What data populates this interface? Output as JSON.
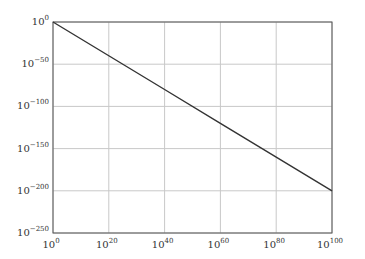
{
  "chart_data": {
    "type": "line",
    "title": "",
    "xlabel": "",
    "ylabel": "",
    "xscale": "log",
    "yscale": "log",
    "xlim_exponent": [
      0,
      100
    ],
    "ylim_exponent": [
      -250,
      0
    ],
    "grid": true,
    "legend": null,
    "x_ticks": [
      {
        "base": "10",
        "exp": "0"
      },
      {
        "base": "10",
        "exp": "20"
      },
      {
        "base": "10",
        "exp": "40"
      },
      {
        "base": "10",
        "exp": "60"
      },
      {
        "base": "10",
        "exp": "80"
      },
      {
        "base": "10",
        "exp": "100"
      }
    ],
    "y_ticks": [
      {
        "base": "10",
        "exp": "0"
      },
      {
        "base": "10",
        "exp": "−50"
      },
      {
        "base": "10",
        "exp": "−100"
      },
      {
        "base": "10",
        "exp": "−150"
      },
      {
        "base": "10",
        "exp": "−200"
      },
      {
        "base": "10",
        "exp": "−250"
      }
    ],
    "series": [
      {
        "name": "y = x^-2",
        "color": "#333333",
        "x_exponent": [
          0,
          20,
          40,
          60,
          80,
          100
        ],
        "y_exponent": [
          0,
          -40,
          -80,
          -120,
          -160,
          -200
        ]
      }
    ]
  },
  "colors": {
    "axis": "#555555",
    "grid": "#c8c8c8",
    "line": "#333333"
  }
}
